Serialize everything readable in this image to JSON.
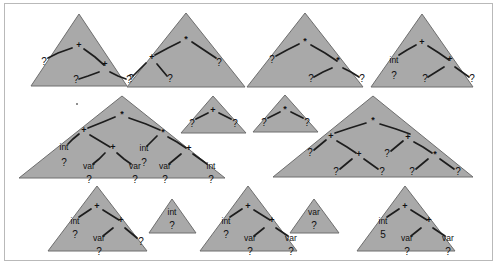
{
  "figure": {
    "background_color": "#ffffff",
    "triangle_fill": "#a9a9a9",
    "triangle_stroke": "#6e6e6e",
    "edge_color": "#1d1d1d",
    "text_color": "#101010",
    "frame_color": "#b9b9b9"
  },
  "symbols": {
    "plus": "+",
    "times": "*",
    "hole": "?",
    "int": "int",
    "var": "var",
    "five": "5"
  },
  "rows": [
    {
      "row_index": 0,
      "trees": [
        {
          "id": "r0-t1",
          "root": "+",
          "nodes": [
            "+",
            "?",
            "+",
            "?",
            "?"
          ],
          "types": [],
          "labels": {
            "root": "+",
            "left": "?",
            "right": "+",
            "right_left": "?",
            "right_right": "?"
          }
        },
        {
          "id": "r0-t2",
          "root": "*",
          "nodes": [
            "*",
            "+",
            "?",
            "?",
            "?"
          ],
          "labels": {
            "root": "*",
            "left": "+",
            "left_left": "?",
            "left_right": "?",
            "right": "?"
          }
        },
        {
          "id": "r0-t3",
          "root": "*",
          "nodes": [
            "*",
            "?",
            "*",
            "?",
            "?"
          ],
          "labels": {
            "root": "*",
            "left": "?",
            "right": "*",
            "right_left": "?",
            "right_right": "?"
          }
        },
        {
          "id": "r0-t4",
          "root": "+",
          "nodes": [
            "+",
            "int",
            "?",
            "+",
            "?",
            "?"
          ],
          "labels": {
            "root": "+",
            "left_type": "int",
            "left": "?",
            "right": "+",
            "right_left": "?",
            "right_right": "?"
          }
        }
      ]
    },
    {
      "row_index": 1,
      "trees": [
        {
          "id": "r1-t1",
          "root": "*",
          "nodes": [
            "*",
            "+",
            "int",
            "?",
            "+",
            "var",
            "?",
            "var",
            "?",
            "*",
            "int",
            "?",
            "+",
            "var",
            "?",
            "int",
            "?"
          ],
          "labels": {
            "root": "*",
            "left": "+",
            "left_left_type": "int",
            "left_left": "?",
            "left_right": "+",
            "left_right_left_type": "var",
            "left_right_left": "?",
            "left_right_right_type": "var",
            "left_right_right": "?",
            "right": "*",
            "right_left_type": "int",
            "right_left": "?",
            "right_right": "+",
            "right_right_left_type": "var",
            "right_right_left": "?",
            "right_right_right_type": "int",
            "right_right_right": "?"
          }
        },
        {
          "id": "r1-t2",
          "root": "+",
          "nodes": [
            "+",
            "?",
            "?"
          ],
          "labels": {
            "root": "+",
            "left": "?",
            "right": "?"
          }
        },
        {
          "id": "r1-t3",
          "root": "*",
          "nodes": [
            "*",
            "?",
            "?"
          ],
          "labels": {
            "root": "*",
            "left": "?",
            "right": "?"
          }
        },
        {
          "id": "r1-t4",
          "root": "*",
          "nodes": [
            "*",
            "+",
            "?",
            "+",
            "?",
            "?",
            "+",
            "?",
            "*",
            "?",
            "?"
          ],
          "labels": {
            "root": "*",
            "left": "+",
            "left_left": "?",
            "left_right": "+",
            "left_right_left": "?",
            "left_right_right": "?",
            "right": "+",
            "right_left": "?",
            "right_right": "*",
            "right_right_left": "?",
            "right_right_right": "?"
          }
        }
      ]
    },
    {
      "row_index": 2,
      "trees": [
        {
          "id": "r2-t1",
          "root": "+",
          "nodes": [
            "+",
            "int",
            "?",
            "+",
            "var",
            "?",
            "?"
          ],
          "labels": {
            "root": "+",
            "left_type": "int",
            "left": "?",
            "right": "+",
            "right_left_type": "var",
            "right_left": "?",
            "right_right": "?"
          }
        },
        {
          "id": "r2-t2",
          "root": "int",
          "nodes": [
            "int",
            "?"
          ],
          "labels": {
            "type": "int",
            "value": "?"
          }
        },
        {
          "id": "r2-t3",
          "root": "+",
          "nodes": [
            "+",
            "int",
            "?",
            "+",
            "var",
            "?",
            "var",
            "?"
          ],
          "labels": {
            "root": "+",
            "left_type": "int",
            "left": "?",
            "right": "+",
            "right_left_type": "var",
            "right_left": "?",
            "right_right_type": "var",
            "right_right": "?"
          }
        },
        {
          "id": "r2-t4",
          "root": "var",
          "nodes": [
            "var",
            "?"
          ],
          "labels": {
            "type": "var",
            "value": "?"
          }
        },
        {
          "id": "r2-t5",
          "root": "+",
          "nodes": [
            "+",
            "int",
            "5",
            "+",
            "var",
            "?",
            "var",
            "?"
          ],
          "labels": {
            "root": "+",
            "left_type": "int",
            "left": "5",
            "right": "+",
            "right_left_type": "var",
            "right_left": "?",
            "right_right_type": "var",
            "right_right": "?"
          }
        }
      ]
    }
  ]
}
